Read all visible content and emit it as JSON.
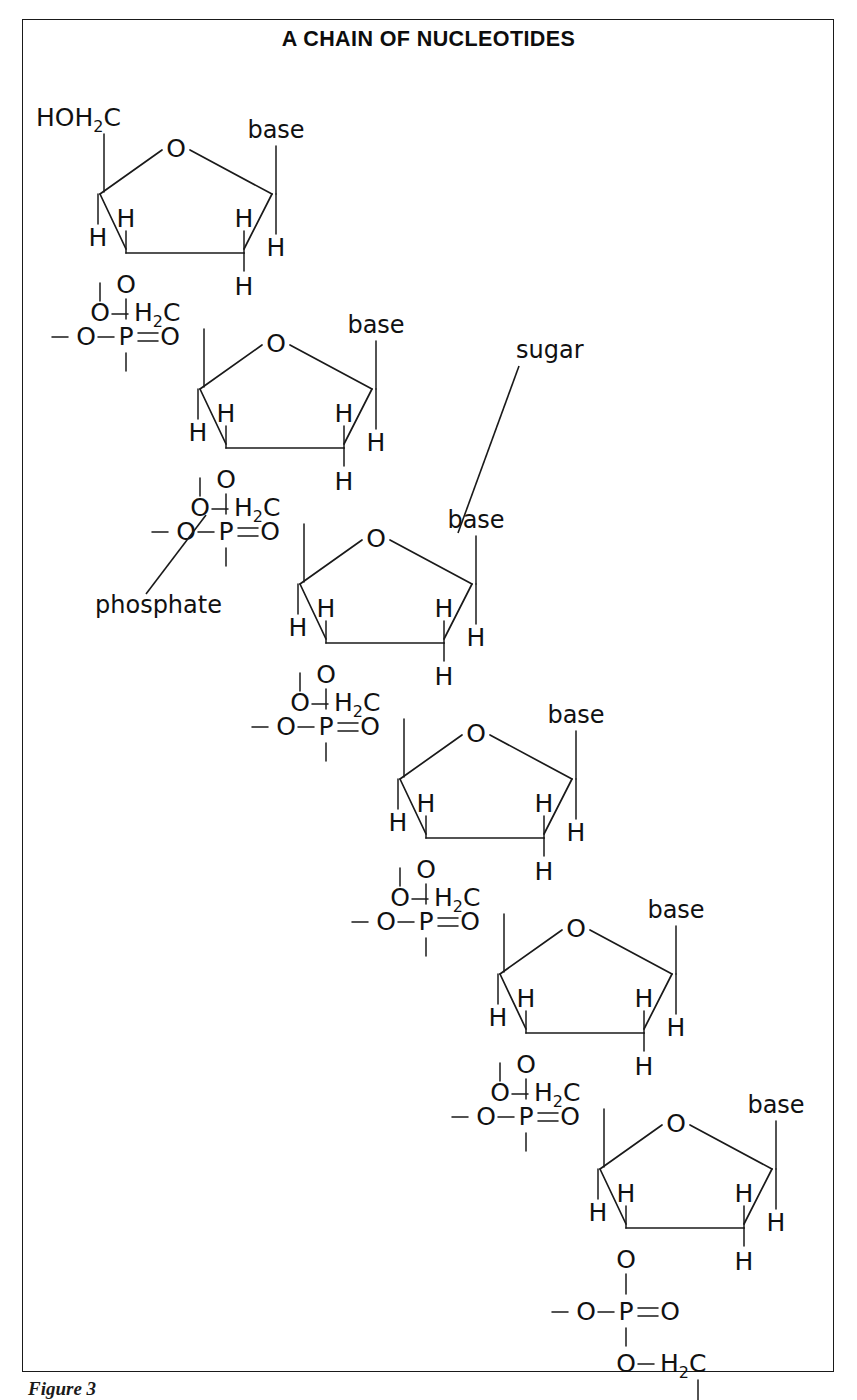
{
  "figure": {
    "title": "A CHAIN OF NUCLEOTIDES",
    "caption": "Figure 3",
    "frame_color": "#1a1a1a",
    "background": "#ffffff",
    "ink_color": "#111111"
  },
  "labels": {
    "base": "base",
    "hydrogen": "H",
    "oxygen": "O",
    "phosphorus": "P",
    "carbon": "C",
    "subscript_two": "2",
    "terminal_head": "HOH",
    "linker_ch2": "H",
    "dash": "—",
    "double_bond_eq": "="
  },
  "annotations": [
    {
      "id": "sugar",
      "text": "sugar"
    },
    {
      "id": "phosphate",
      "text": "phosphate"
    }
  ],
  "chain": {
    "unit_count": 6,
    "head_group": "HOH2C",
    "tail_group": "O—H2C",
    "phosphate_group": "—O—P=O",
    "linker_group": "O—H2C",
    "ring_apex_atom": "O",
    "ring_bottom_left_atom": "O",
    "ring_substituents": {
      "c4_prime_left": "H",
      "c3_prime_upper": "H",
      "c2_prime_upper": "H",
      "c2_prime_lower": "H",
      "c1_prime_right": "H"
    },
    "units": [
      {
        "index": 1,
        "x_offset": 0,
        "y_offset": 0,
        "head": "HOH2C",
        "has_phosphate_below": true
      },
      {
        "index": 2,
        "x_offset": 100,
        "y_offset": 195,
        "head": "O—H2C",
        "has_phosphate_below": true
      },
      {
        "index": 3,
        "x_offset": 200,
        "y_offset": 390,
        "head": "O—H2C",
        "has_phosphate_below": true
      },
      {
        "index": 4,
        "x_offset": 300,
        "y_offset": 585,
        "head": "O—H2C",
        "has_phosphate_below": true
      },
      {
        "index": 5,
        "x_offset": 400,
        "y_offset": 780,
        "head": "O—H2C",
        "has_phosphate_below": true
      },
      {
        "index": 6,
        "x_offset": 500,
        "y_offset": 975,
        "head": "O—H2C",
        "has_phosphate_below": true
      }
    ]
  }
}
